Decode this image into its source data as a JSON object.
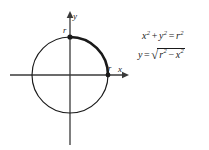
{
  "figure": {
    "kind": "circle-graph",
    "background_color": "#ffffff",
    "stroke_color": "#1a1a1a",
    "axis_color": "#3a3a3a",
    "circle": {
      "center_x": 70,
      "center_y": 75,
      "radius": 38,
      "stroke_width": 1.1,
      "highlight_arc": {
        "description": "first-quadrant arc",
        "start_angle_deg": 0,
        "end_angle_deg": 90,
        "stroke_width": 2.6
      }
    },
    "axes": {
      "x_axis": {
        "label": "x",
        "y_position": 75,
        "x_start": 10,
        "x_end": 128,
        "arrow": "right"
      },
      "y_axis": {
        "label": "y",
        "x_position": 70,
        "y_start": 145,
        "y_end": 12,
        "arrow": "up"
      }
    },
    "points": [
      {
        "name": "y-intercept",
        "label": "r",
        "x": 70,
        "y": 37
      },
      {
        "name": "x-intercept",
        "label": "r",
        "x": 108,
        "y": 75
      }
    ],
    "labels": {
      "y_axis_label": "y",
      "x_axis_label": "x",
      "y_intercept_label": "r",
      "x_intercept_label": "r"
    }
  },
  "equations": {
    "equation_1": {
      "full_text": "x² + y² = r²",
      "lhs_var_1": "x",
      "lhs_exp_1": "2",
      "plus": "+",
      "lhs_var_2": "y",
      "lhs_exp_2": "2",
      "equals": "=",
      "rhs_var": "r",
      "rhs_exp": "2"
    },
    "equation_2": {
      "full_text": "y = √(r² − x²)",
      "lhs_var": "y",
      "equals": "=",
      "radical_sign": "√",
      "rad_var_1": "r",
      "rad_exp_1": "2",
      "minus": "−",
      "rad_var_2": "x",
      "rad_exp_2": "2"
    }
  }
}
